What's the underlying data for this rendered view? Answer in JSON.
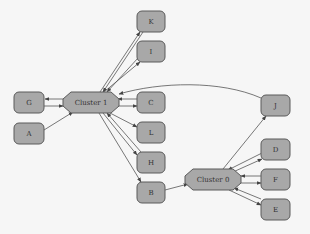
{
  "diagram": {
    "type": "graph",
    "colors": {
      "node_fill": "#a8a8a8",
      "node_stroke": "#5a5a5a",
      "edge": "#555555",
      "background": "#f6f6f6"
    },
    "clusters": [
      {
        "id": "cluster1",
        "label": "Cluster 1",
        "x": 63,
        "y": 92,
        "w": 56,
        "h": 21
      },
      {
        "id": "cluster0",
        "label": "Cluster 0",
        "x": 185,
        "y": 169,
        "w": 56,
        "h": 21
      }
    ],
    "nodes": [
      {
        "id": "K",
        "label": "K",
        "x": 137,
        "y": 11
      },
      {
        "id": "I",
        "label": "I",
        "x": 137,
        "y": 41
      },
      {
        "id": "G",
        "label": "G",
        "x": 14,
        "y": 92
      },
      {
        "id": "A",
        "label": "A",
        "x": 14,
        "y": 123
      },
      {
        "id": "C",
        "label": "C",
        "x": 137,
        "y": 92
      },
      {
        "id": "L",
        "label": "L",
        "x": 137,
        "y": 122
      },
      {
        "id": "H",
        "label": "H",
        "x": 137,
        "y": 152
      },
      {
        "id": "B",
        "label": "B",
        "x": 137,
        "y": 182
      },
      {
        "id": "J",
        "label": "J",
        "x": 261,
        "y": 95
      },
      {
        "id": "D",
        "label": "D",
        "x": 261,
        "y": 139
      },
      {
        "id": "F",
        "label": "F",
        "x": 261,
        "y": 169
      },
      {
        "id": "E",
        "label": "E",
        "x": 261,
        "y": 199
      }
    ],
    "edges": [
      {
        "from": "Cluster 1",
        "to": "K"
      },
      {
        "from": "K",
        "to": "Cluster 1"
      },
      {
        "from": "Cluster 1",
        "to": "I"
      },
      {
        "from": "I",
        "to": "Cluster 1"
      },
      {
        "from": "Cluster 1",
        "to": "G"
      },
      {
        "from": "G",
        "to": "Cluster 1"
      },
      {
        "from": "A",
        "to": "Cluster 1"
      },
      {
        "from": "Cluster 1",
        "to": "C"
      },
      {
        "from": "C",
        "to": "Cluster 1"
      },
      {
        "from": "Cluster 1",
        "to": "L"
      },
      {
        "from": "Cluster 1",
        "to": "H"
      },
      {
        "from": "H",
        "to": "Cluster 1"
      },
      {
        "from": "Cluster 1",
        "to": "B"
      },
      {
        "from": "J",
        "to": "Cluster 1"
      },
      {
        "from": "B",
        "to": "Cluster 0"
      },
      {
        "from": "Cluster 0",
        "to": "J"
      },
      {
        "from": "Cluster 0",
        "to": "D"
      },
      {
        "from": "D",
        "to": "Cluster 0"
      },
      {
        "from": "Cluster 0",
        "to": "F"
      },
      {
        "from": "F",
        "to": "Cluster 0"
      },
      {
        "from": "Cluster 0",
        "to": "E"
      },
      {
        "from": "E",
        "to": "Cluster 0"
      }
    ]
  }
}
